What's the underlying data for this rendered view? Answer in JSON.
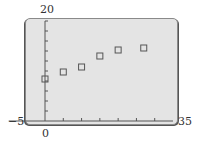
{
  "chart_data": {
    "type": "scatter",
    "title": "",
    "xlabel": "",
    "ylabel": "",
    "xlim": [
      -5,
      35
    ],
    "ylim": [
      0,
      20
    ],
    "x_tick_step": 5,
    "y_tick_step": 2,
    "grid": false,
    "marker": "square",
    "series": [
      {
        "name": "data",
        "points": [
          {
            "x": 0,
            "y": 8.4
          },
          {
            "x": 5,
            "y": 9.8
          },
          {
            "x": 10,
            "y": 10.8
          },
          {
            "x": 15,
            "y": 13
          },
          {
            "x": 20,
            "y": 14.2
          },
          {
            "x": 27,
            "y": 14.6
          }
        ]
      }
    ],
    "labels": {
      "xmin": "−5",
      "xmax": "35",
      "ymax": "20",
      "origin": "0"
    }
  },
  "colors": {
    "screen": "#e4e4e4",
    "axis": "#555555",
    "marker": "#555555"
  }
}
